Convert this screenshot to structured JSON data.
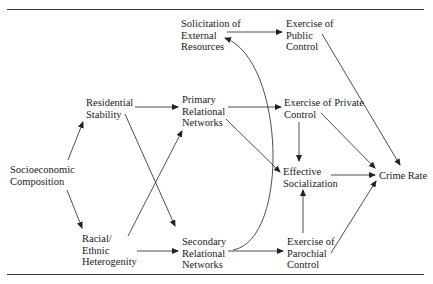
{
  "diagram": {
    "nodes": {
      "socioeconomic": {
        "lines": [
          "Socioeconomic",
          "Composition"
        ]
      },
      "residential": {
        "lines": [
          "Residential",
          "Stability"
        ]
      },
      "racial": {
        "lines": [
          "Racial/",
          "Ethnic",
          "Heterogenity"
        ]
      },
      "primary": {
        "lines": [
          "Primary",
          "Relational",
          "Networks"
        ]
      },
      "secondary": {
        "lines": [
          "Secondary",
          "Relational",
          "Networks"
        ]
      },
      "solicitation": {
        "lines": [
          "Solicitation of",
          "External",
          "Resources"
        ]
      },
      "public": {
        "lines": [
          "Exercise of",
          "Public",
          "Control"
        ]
      },
      "private": {
        "lines": [
          "Exercise of Private",
          "Control"
        ]
      },
      "parochial": {
        "lines": [
          "Exercise of",
          "Parochial",
          "Control"
        ]
      },
      "socialization": {
        "lines": [
          "Effective",
          "Socialization"
        ]
      },
      "crime": {
        "lines": [
          "Crime Rate"
        ]
      }
    },
    "edges": [
      {
        "from": "socioeconomic",
        "to": "residential"
      },
      {
        "from": "socioeconomic",
        "to": "racial"
      },
      {
        "from": "residential",
        "to": "primary"
      },
      {
        "from": "residential",
        "to": "secondary"
      },
      {
        "from": "racial",
        "to": "primary"
      },
      {
        "from": "racial",
        "to": "secondary"
      },
      {
        "from": "primary",
        "to": "private"
      },
      {
        "from": "primary",
        "to": "socialization"
      },
      {
        "from": "secondary",
        "to": "parochial"
      },
      {
        "from": "secondary",
        "to": "solicitation",
        "curved": true
      },
      {
        "from": "solicitation",
        "to": "public"
      },
      {
        "from": "public",
        "to": "crime"
      },
      {
        "from": "private",
        "to": "socialization"
      },
      {
        "from": "private",
        "to": "crime"
      },
      {
        "from": "parochial",
        "to": "socialization"
      },
      {
        "from": "parochial",
        "to": "crime"
      },
      {
        "from": "socialization",
        "to": "crime"
      }
    ]
  }
}
